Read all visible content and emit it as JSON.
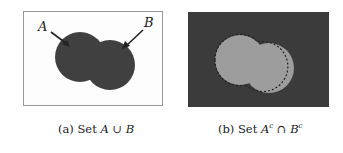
{
  "figure": {
    "panel_a": {
      "caption_prefix": "(a) Set",
      "caption_math_1": "A",
      "caption_op": " ∪ ",
      "caption_math_2": "B",
      "label_a": "A",
      "label_b": "B",
      "fill_color": "#404040",
      "background_color": "#fdfdfd",
      "border_color": "#9a9a9a"
    },
    "panel_b": {
      "caption_prefix": "(b) Set",
      "caption_math_1": "A",
      "caption_sup_1": "c",
      "caption_op": " ∩ ",
      "caption_math_2": "B",
      "caption_sup_2": "c",
      "fill_color": "#3b3b3b",
      "hole_color": "#9d9d9d"
    }
  }
}
